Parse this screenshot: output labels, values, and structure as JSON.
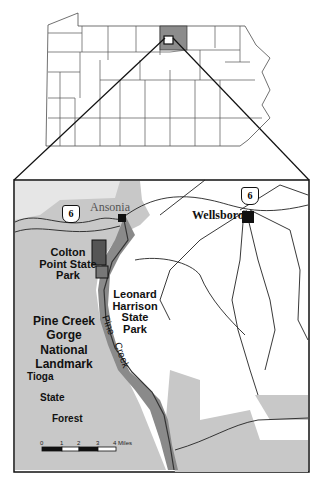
{
  "figure": {
    "overview": {
      "state": "Pennsylvania",
      "highlighted_county": "Tioga"
    },
    "inset": {
      "towns": [
        {
          "name": "Ansonia"
        },
        {
          "name": "Wellsboro"
        }
      ],
      "route_shield": "6",
      "parks": {
        "colton": "Colton Point State Park",
        "leonard": "Leonard Harrison State Park"
      },
      "landmark": [
        "Pine Creek",
        "Gorge",
        "National",
        "Landmark"
      ],
      "forest": [
        "Tioga",
        "State",
        "Forest"
      ],
      "creek": [
        "Pine",
        "Creek"
      ],
      "scale": {
        "ticks": [
          "0",
          "1",
          "2",
          "3",
          "4 Miles"
        ]
      }
    },
    "colors": {
      "forest": "#c8c8c8",
      "gorge": "#8a8a8a",
      "county": "#8c8c8c",
      "line": "#111111"
    }
  }
}
